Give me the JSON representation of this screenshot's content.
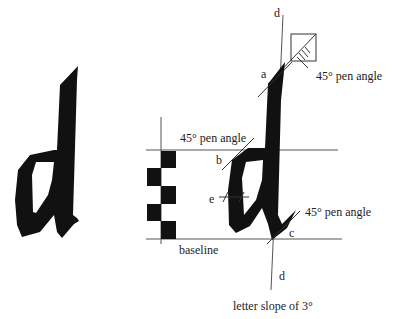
{
  "diagram": {
    "type": "calligraphy letter construction",
    "letter": "d",
    "colors": {
      "ink": "#111111",
      "line": "#555555",
      "text": "#222222",
      "background": "#ffffff"
    },
    "labels": {
      "d_top": "d",
      "a": "a",
      "pen_angle_top": "45° pen angle",
      "pen_angle_left": "45° pen angle",
      "b": "b",
      "e": "e",
      "pen_angle_right": "45° pen angle",
      "c": "c",
      "baseline": "baseline",
      "d_bottom": "d",
      "letter_slope": "letter slope of 3°"
    },
    "nib_widths_count": 5
  }
}
